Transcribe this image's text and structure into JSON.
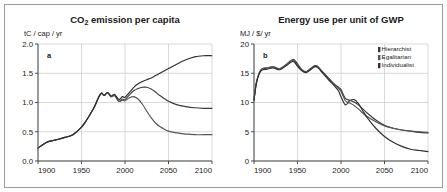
{
  "figure": {
    "background": "#ffffff",
    "frame_color": "#9b9b9b"
  },
  "chart_data": [
    {
      "type": "line",
      "panel_letter": "a",
      "title": "CO2 emission per capita",
      "title_main": "CO",
      "title_sub": "2",
      "title_rest": " emission per capita",
      "ylabel": "tC / cap / yr",
      "xlabel": "",
      "xlim": [
        1900,
        2100
      ],
      "ylim": [
        0.0,
        2.0
      ],
      "xticks": [
        1900,
        1950,
        2000,
        2050,
        2100
      ],
      "xticklabels": [
        "1900",
        "1950",
        "2000",
        "2050",
        "2100"
      ],
      "yticks": [
        0.0,
        0.5,
        1.0,
        1.5,
        2.0
      ],
      "yticklabels": [
        "0.0",
        "0.5",
        "1.0",
        "1.5",
        "2.0"
      ],
      "grid": true,
      "legend": false,
      "x": [
        1900,
        1910,
        1920,
        1930,
        1940,
        1950,
        1955,
        1960,
        1965,
        1970,
        1973,
        1976,
        1980,
        1984,
        1988,
        1993,
        1997,
        2000,
        2005,
        2010,
        2015,
        2020,
        2025,
        2030,
        2035,
        2040,
        2050,
        2060,
        2070,
        2080,
        2090,
        2100
      ],
      "series": [
        {
          "name": "Hierarchist",
          "color": "#3a3a3a",
          "values": [
            0.22,
            0.32,
            0.36,
            0.4,
            0.45,
            0.58,
            0.68,
            0.8,
            0.93,
            1.1,
            1.16,
            1.12,
            1.17,
            1.1,
            1.12,
            1.02,
            1.06,
            1.05,
            1.13,
            1.2,
            1.24,
            1.26,
            1.26,
            1.23,
            1.18,
            1.12,
            1.02,
            0.96,
            0.93,
            0.91,
            0.9,
            0.9
          ]
        },
        {
          "name": "Egalitarian",
          "color": "#555555",
          "values": [
            0.22,
            0.32,
            0.36,
            0.4,
            0.45,
            0.58,
            0.68,
            0.8,
            0.93,
            1.1,
            1.16,
            1.12,
            1.17,
            1.1,
            1.12,
            1.02,
            1.04,
            1.03,
            1.08,
            1.1,
            1.06,
            0.97,
            0.85,
            0.74,
            0.65,
            0.59,
            0.51,
            0.48,
            0.46,
            0.45,
            0.45,
            0.45
          ]
        },
        {
          "name": "Individualist",
          "color": "#2f2f2f",
          "values": [
            0.22,
            0.32,
            0.36,
            0.4,
            0.45,
            0.58,
            0.68,
            0.8,
            0.93,
            1.1,
            1.16,
            1.12,
            1.17,
            1.11,
            1.14,
            1.05,
            1.1,
            1.09,
            1.17,
            1.26,
            1.32,
            1.36,
            1.39,
            1.42,
            1.46,
            1.5,
            1.58,
            1.66,
            1.73,
            1.78,
            1.8,
            1.8
          ]
        }
      ]
    },
    {
      "type": "line",
      "panel_letter": "b",
      "title": "Energy use per unit of GWP",
      "ylabel": "MJ / $/ yr",
      "xlabel": "",
      "xlim": [
        1900,
        2100
      ],
      "ylim": [
        0,
        20
      ],
      "xticks": [
        1900,
        1950,
        2000,
        2050,
        2100
      ],
      "xticklabels": [
        "1900",
        "1950",
        "2000",
        "2050",
        "2100"
      ],
      "yticks": [
        0,
        5,
        10,
        15,
        20
      ],
      "yticklabels": [
        "0",
        "5",
        "10",
        "15",
        "20"
      ],
      "grid": true,
      "legend": true,
      "legend_position": "top-right",
      "x": [
        1900,
        1903,
        1908,
        1915,
        1922,
        1930,
        1938,
        1945,
        1950,
        1955,
        1960,
        1965,
        1970,
        1973,
        1978,
        1985,
        1992,
        1997,
        2000,
        2005,
        2010,
        2015,
        2020,
        2025,
        2030,
        2040,
        2050,
        2060,
        2070,
        2080,
        2090,
        2100
      ],
      "series": [
        {
          "name": "Hierarchist",
          "color": "#3a3a3a",
          "values": [
            10.4,
            13.6,
            15.6,
            15.9,
            16.1,
            15.8,
            16.6,
            17.4,
            16.6,
            15.6,
            15.3,
            15.8,
            16.3,
            16.2,
            15.4,
            14.3,
            13.2,
            12.6,
            12.2,
            10.7,
            10.4,
            10.1,
            9.6,
            8.9,
            8.2,
            7.0,
            6.1,
            5.6,
            5.3,
            5.1,
            4.9,
            4.8
          ]
        },
        {
          "name": "Egalitarian",
          "color": "#555555",
          "values": [
            10.4,
            13.6,
            15.6,
            15.9,
            16.1,
            15.8,
            16.6,
            17.2,
            16.4,
            15.5,
            15.2,
            15.7,
            16.2,
            16.1,
            15.3,
            14.2,
            13.1,
            12.4,
            11.9,
            10.3,
            9.9,
            9.5,
            8.9,
            8.2,
            7.6,
            6.7,
            6.0,
            5.6,
            5.3,
            5.1,
            5.0,
            4.9
          ]
        },
        {
          "name": "Individualist",
          "color": "#2f2f2f",
          "values": [
            10.4,
            13.4,
            15.4,
            15.7,
            15.9,
            15.6,
            16.4,
            17.0,
            16.2,
            15.4,
            15.1,
            15.6,
            16.1,
            16.0,
            15.2,
            14.0,
            12.9,
            12.0,
            11.0,
            9.6,
            10.3,
            10.5,
            9.8,
            8.6,
            7.4,
            5.6,
            4.2,
            3.2,
            2.5,
            2.0,
            1.8,
            1.6
          ]
        }
      ],
      "legend_entries": [
        {
          "label": "Hierarchist",
          "color": "#3a3a3a"
        },
        {
          "label": "Egalitarian",
          "color": "#555555"
        },
        {
          "label": "Individualist",
          "color": "#2f2f2f"
        }
      ]
    }
  ]
}
